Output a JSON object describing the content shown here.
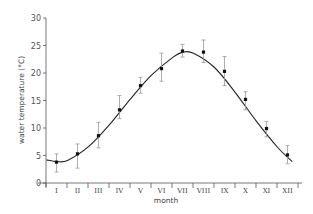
{
  "chart_data": {
    "type": "line",
    "title": "",
    "xlabel": "month",
    "ylabel": "water temperature (°C)",
    "ylim": [
      0,
      30
    ],
    "yticks": [
      0,
      5,
      10,
      15,
      20,
      25,
      30
    ],
    "grid": false,
    "legend": null,
    "categories": [
      "I",
      "II",
      "III",
      "IV",
      "V",
      "VI",
      "VII",
      "VIII",
      "IX",
      "X",
      "XI",
      "XII"
    ],
    "series": [
      {
        "name": "mean monthly water temperature",
        "style": "points with error bars",
        "values": [
          3.8,
          5.3,
          8.6,
          13.3,
          17.7,
          20.8,
          24.0,
          23.8,
          20.3,
          15.2,
          9.9,
          5.1
        ],
        "error_upper": [
          5.3,
          7.1,
          11.0,
          15.9,
          19.2,
          23.6,
          25.2,
          26.0,
          23.0,
          16.6,
          11.2,
          6.8
        ],
        "error_lower": [
          2.0,
          2.7,
          6.4,
          11.7,
          16.3,
          18.5,
          22.9,
          21.9,
          17.7,
          13.3,
          8.4,
          3.5
        ]
      },
      {
        "name": "fitted curve",
        "style": "smooth line",
        "x": [
          0.0,
          0.5,
          1.0,
          2.0,
          3.0,
          4.0,
          5.0,
          6.0,
          6.5,
          7.0,
          8.0,
          9.0,
          10.0,
          11.0,
          11.7
        ],
        "values": [
          4.2,
          3.9,
          4.1,
          6.6,
          10.6,
          15.3,
          19.6,
          22.8,
          23.8,
          23.6,
          21.0,
          16.4,
          11.2,
          6.5,
          3.9
        ]
      }
    ]
  },
  "axes": {
    "ylabel": "water temperature (°C)",
    "xlabel": "month"
  }
}
